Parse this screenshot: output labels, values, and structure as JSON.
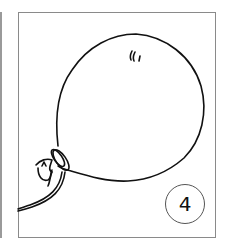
{
  "illustration": {
    "subject": "balloon-line-drawing",
    "stroke_color": "#111111",
    "frame_color": "#8a8a8a"
  },
  "badge": {
    "number": "4"
  }
}
